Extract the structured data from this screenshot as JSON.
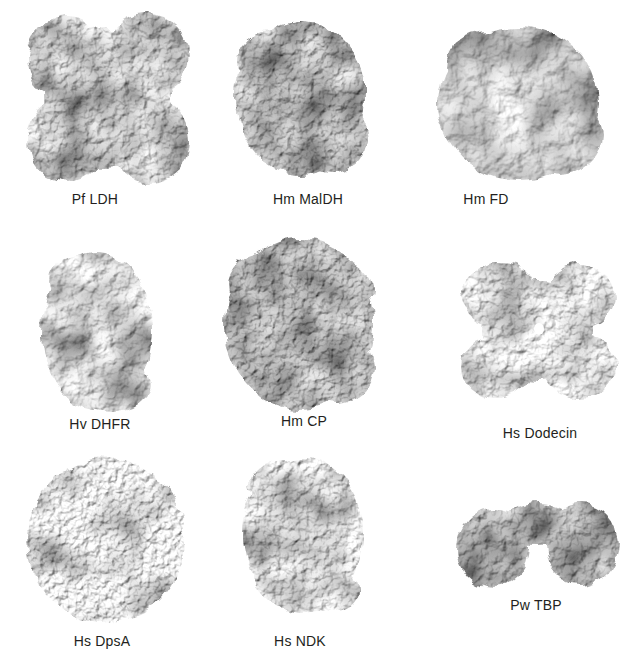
{
  "figure": {
    "background_color": "#ffffff",
    "label_color": "#231f20",
    "proteins": [
      {
        "label": "Pf LDH"
      },
      {
        "label": "Hm MalDH"
      },
      {
        "label": "Hm FD"
      },
      {
        "label": "Hv DHFR"
      },
      {
        "label": "Hm CP"
      },
      {
        "label": "Hs Dodecin"
      },
      {
        "label": "Hs DpsA"
      },
      {
        "label": "Hs NDK"
      },
      {
        "label": "Pw TBP"
      }
    ]
  }
}
